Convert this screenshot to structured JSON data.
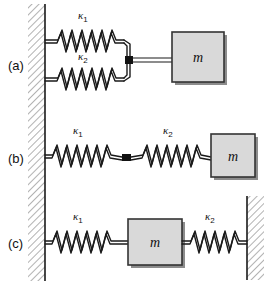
{
  "figure": {
    "background_color": "#ffffff",
    "line_color": "#1a1a1a",
    "mass_fill_color": "#d9d9d9",
    "mass_stroke_color": "#333333",
    "hatch_color": "#555555",
    "connector_color": "#111111",
    "width": 270,
    "height": 290
  },
  "rows": [
    {
      "id": "a",
      "label": "(a)",
      "arrangement": "parallel",
      "springs": [
        {
          "symbol": "κ",
          "subscript": "1",
          "position": "upper"
        },
        {
          "symbol": "κ",
          "subscript": "2",
          "position": "lower"
        }
      ],
      "mass": {
        "label": "m"
      },
      "walls": [
        "left"
      ],
      "has_connector_square": true
    },
    {
      "id": "b",
      "label": "(b)",
      "arrangement": "series",
      "springs": [
        {
          "symbol": "κ",
          "subscript": "1",
          "position": "left"
        },
        {
          "symbol": "κ",
          "subscript": "2",
          "position": "right"
        }
      ],
      "mass": {
        "label": "m"
      },
      "walls": [
        "left"
      ],
      "has_connector_square": true
    },
    {
      "id": "c",
      "label": "(c)",
      "arrangement": "both-sides",
      "springs": [
        {
          "symbol": "κ",
          "subscript": "1",
          "position": "left"
        },
        {
          "symbol": "κ",
          "subscript": "2",
          "position": "right"
        }
      ],
      "mass": {
        "label": "m"
      },
      "walls": [
        "left",
        "right"
      ],
      "has_connector_square": false
    }
  ]
}
